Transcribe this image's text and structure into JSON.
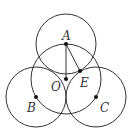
{
  "diagram": {
    "type": "geometry",
    "stroke_color": "#333333",
    "circles": [
      {
        "name": "circle-A",
        "cx": 66,
        "cy": 44,
        "r": 30
      },
      {
        "name": "circle-O",
        "cx": 66,
        "cy": 79,
        "r": 35
      },
      {
        "name": "circle-B",
        "cx": 36,
        "cy": 97,
        "r": 30
      },
      {
        "name": "circle-C",
        "cx": 96,
        "cy": 97,
        "r": 30
      }
    ],
    "points": [
      {
        "name": "A",
        "x": 66,
        "y": 44
      },
      {
        "name": "O",
        "x": 66,
        "y": 79
      },
      {
        "name": "E",
        "x": 80,
        "y": 71
      },
      {
        "name": "B",
        "x": 36,
        "y": 97
      },
      {
        "name": "C",
        "x": 96,
        "y": 97
      }
    ],
    "segments": [
      {
        "from": "A",
        "to": "O"
      },
      {
        "from": "A",
        "to": "E"
      }
    ],
    "labels": {
      "A": "A",
      "O": "O",
      "E": "E",
      "B": "B",
      "C": "C"
    }
  }
}
